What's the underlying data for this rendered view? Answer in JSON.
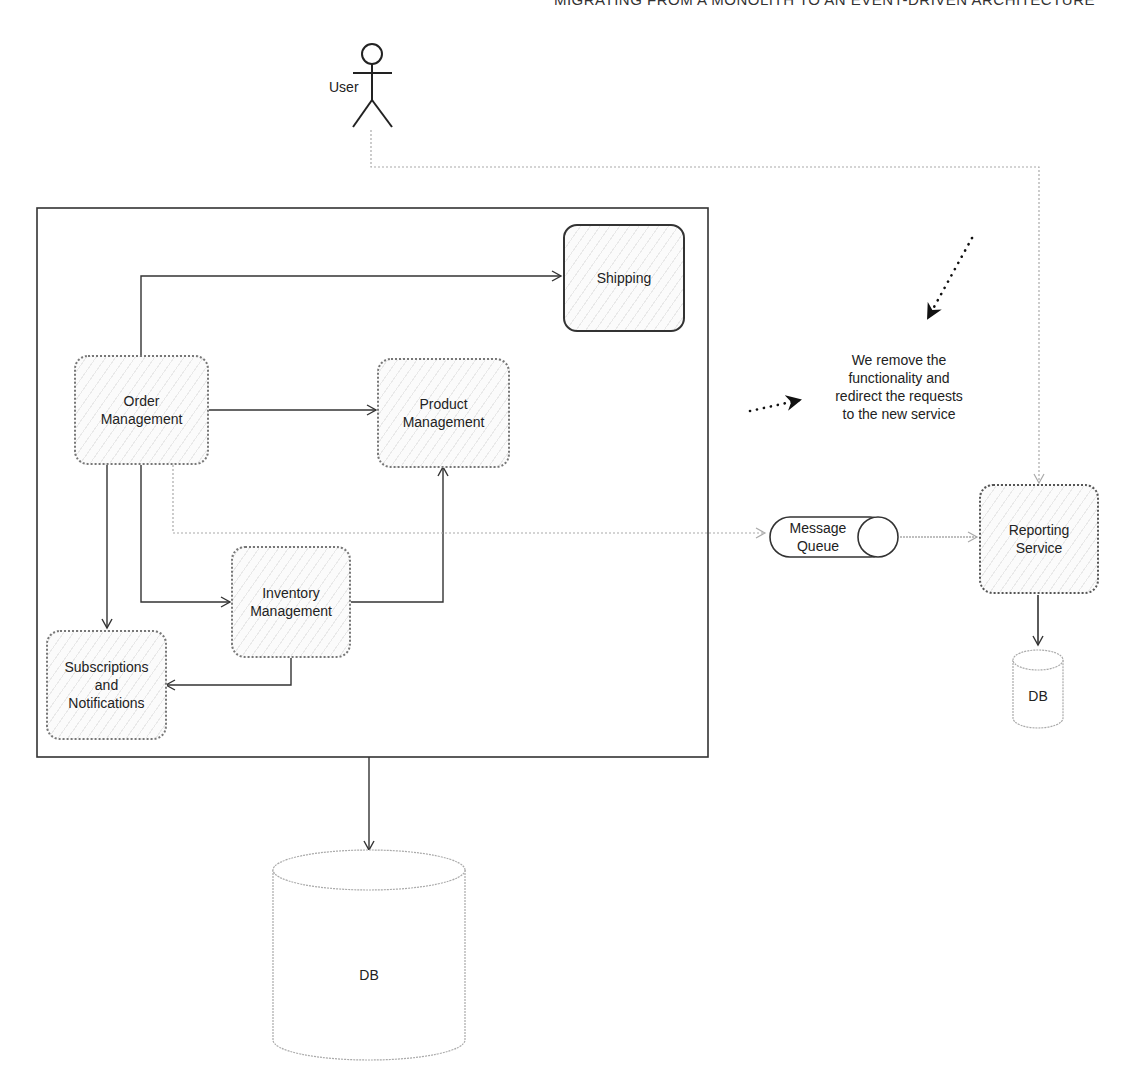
{
  "title": "MIGRATING FROM A MONOLITH TO AN EVENT-DRIVEN ARCHITECTURE",
  "actor": {
    "label": "User",
    "icon": "stick-figure"
  },
  "monolith": {
    "nodes": {
      "shipping": {
        "label": "Shipping"
      },
      "order_management": {
        "label": "Order\nManagement",
        "line1": "Order",
        "line2": "Management"
      },
      "product_management": {
        "label": "Product Management",
        "line1": "Product",
        "line2": "Management"
      },
      "inventory_management": {
        "label": "Inventory Management",
        "line1": "Inventory",
        "line2": "Management"
      },
      "subscriptions": {
        "label": "Subscriptions and Notifications",
        "line1": "Subscriptions",
        "line2": "and",
        "line3": "Notifications"
      }
    },
    "db": {
      "label": "DB"
    }
  },
  "message_queue": {
    "line1": "Message",
    "line2": "Queue"
  },
  "reporting_service": {
    "line1": "Reporting",
    "line2": "Service"
  },
  "reporting_db": {
    "label": "DB"
  },
  "annotation": {
    "line1": "We remove the",
    "line2": "functionality and",
    "line3": "redirect the requests",
    "line4": "to the new service"
  },
  "edges": [
    {
      "from": "Order Management",
      "to": "Shipping",
      "style": "solid"
    },
    {
      "from": "Order Management",
      "to": "Product Management",
      "style": "solid"
    },
    {
      "from": "Order Management",
      "to": "Inventory Management",
      "style": "solid"
    },
    {
      "from": "Order Management",
      "to": "Subscriptions and Notifications",
      "style": "solid"
    },
    {
      "from": "Inventory Management",
      "to": "Product Management",
      "style": "solid"
    },
    {
      "from": "Inventory Management",
      "to": "Subscriptions and Notifications",
      "style": "solid"
    },
    {
      "from": "Order Management",
      "to": "Message Queue",
      "style": "dotted"
    },
    {
      "from": "Message Queue",
      "to": "Reporting Service",
      "style": "dotted"
    },
    {
      "from": "User",
      "to": "Reporting Service",
      "style": "dotted"
    },
    {
      "from": "Reporting Service",
      "to": "DB",
      "style": "solid"
    },
    {
      "from": "Monolith",
      "to": "DB",
      "style": "solid"
    }
  ]
}
